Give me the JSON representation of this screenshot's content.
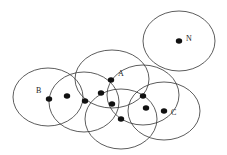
{
  "diagram": {
    "stroke_color": "#333333",
    "dot_color": "#111111",
    "circles": [
      {
        "name": "circle-n",
        "cx": 179,
        "cy": 41,
        "rx": 36,
        "ry": 30
      },
      {
        "name": "circle-b",
        "cx": 48,
        "cy": 97,
        "rx": 35,
        "ry": 29
      },
      {
        "name": "circle-2",
        "cx": 84,
        "cy": 102,
        "rx": 35,
        "ry": 30
      },
      {
        "name": "circle-a",
        "cx": 112,
        "cy": 79,
        "rx": 37,
        "ry": 29
      },
      {
        "name": "circle-right",
        "cx": 143,
        "cy": 95,
        "rx": 36,
        "ry": 30
      },
      {
        "name": "circle-bottom",
        "cx": 121,
        "cy": 119,
        "rx": 36,
        "ry": 30
      },
      {
        "name": "circle-c",
        "cx": 164,
        "cy": 111,
        "rx": 36,
        "ry": 29
      }
    ],
    "points": [
      {
        "name": "point-b",
        "x": 49,
        "y": 99
      },
      {
        "name": "point-2",
        "x": 67,
        "y": 96
      },
      {
        "name": "point-3",
        "x": 85,
        "y": 101
      },
      {
        "name": "point-4",
        "x": 101,
        "y": 93
      },
      {
        "name": "point-a",
        "x": 111,
        "y": 80
      },
      {
        "name": "point-6",
        "x": 112,
        "y": 104
      },
      {
        "name": "point-7",
        "x": 121,
        "y": 119
      },
      {
        "name": "point-8",
        "x": 143,
        "y": 96
      },
      {
        "name": "point-9",
        "x": 146,
        "y": 108
      },
      {
        "name": "point-c",
        "x": 164,
        "y": 111
      },
      {
        "name": "point-n",
        "x": 179,
        "y": 41
      }
    ],
    "labels": [
      {
        "name": "label-b",
        "text": "B",
        "x": 36,
        "y": 93
      },
      {
        "name": "label-a",
        "text": "A",
        "x": 118,
        "y": 76
      },
      {
        "name": "label-c",
        "text": "C",
        "x": 171,
        "y": 115
      },
      {
        "name": "label-n",
        "text": "N",
        "x": 186,
        "y": 41
      }
    ]
  }
}
